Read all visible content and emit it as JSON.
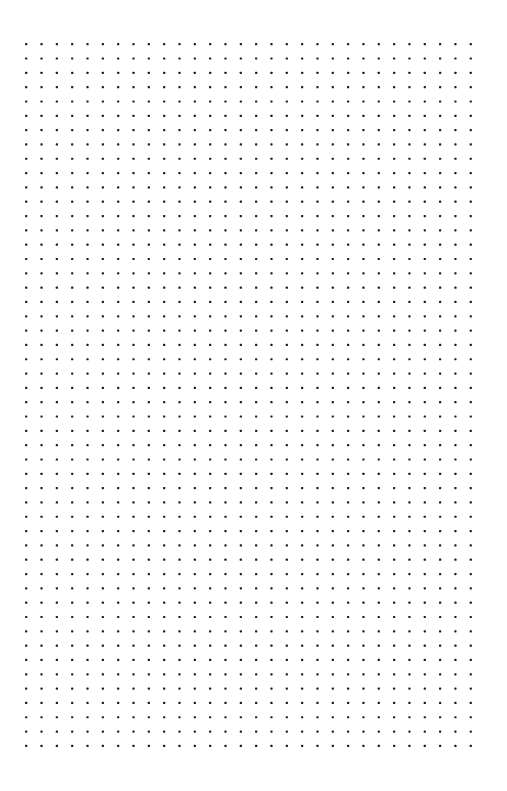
{
  "page": {
    "width": 507,
    "height": 791,
    "background_color": "#ffffff"
  },
  "dot_grid": {
    "columns": 30,
    "rows": 50,
    "origin_x": 26.2,
    "origin_y": 44.2,
    "spacing_x": 15.33,
    "spacing_y": 14.32,
    "dot_size": 2.2,
    "dot_color": "#1a1a1a"
  }
}
